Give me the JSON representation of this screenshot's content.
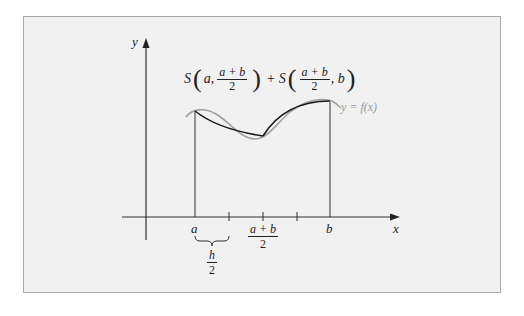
{
  "figure": {
    "title_expression": {
      "left_S": "S",
      "left_arg1": "a,",
      "left_frac_num": "a + b",
      "left_frac_den": "2",
      "plus": "+",
      "right_S": "S",
      "right_frac_num": "a + b",
      "right_frac_den": "2",
      "right_arg2": ", b"
    },
    "curve_label": "y = f(x)",
    "axes": {
      "x_label": "x",
      "y_label": "y"
    },
    "tick_labels": {
      "a": "a",
      "mid_num": "a + b",
      "mid_den": "2",
      "b": "b"
    },
    "brace_label": {
      "num": "h",
      "den": "2"
    },
    "colors": {
      "background": "#f1f1f1",
      "border": "#a9a9a9",
      "axis": "#333333",
      "approx_curve": "#1a1a1a",
      "function_curve": "#a0a0a0"
    }
  }
}
